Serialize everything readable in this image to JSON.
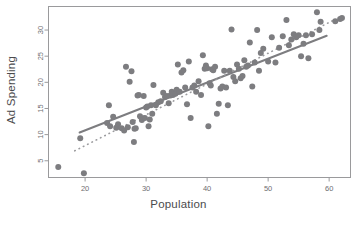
{
  "chart_data": {
    "type": "scatter",
    "title": "",
    "xlabel": "Population",
    "ylabel": "Ad Spending",
    "xlim": [
      14.0,
      63.5
    ],
    "ylim": [
      1.8,
      34.5
    ],
    "xticks": [
      20,
      30,
      40,
      50,
      60
    ],
    "yticks": [
      5,
      10,
      15,
      20,
      25,
      30
    ],
    "grid": false,
    "legend": "none",
    "point_color": "#7d7d80",
    "line_color": "#7d7d80",
    "frame_color": "#9a9a9c",
    "marker": "circle",
    "marker_size": 3.0,
    "series": [
      {
        "name": "Observations",
        "type": "scatter",
        "x": [
          15.6,
          19.2,
          19.8,
          23.6,
          23.9,
          24.1,
          24.6,
          25.1,
          25.4,
          26.0,
          26.4,
          26.7,
          27.0,
          27.3,
          27.6,
          27.8,
          28.0,
          28.1,
          28.3,
          28.6,
          28.8,
          29.0,
          29.3,
          29.6,
          29.8,
          30.0,
          30.2,
          30.4,
          30.6,
          30.8,
          31.0,
          31.2,
          31.6,
          32.0,
          32.4,
          32.8,
          33.1,
          33.4,
          33.7,
          34.0,
          34.2,
          34.4,
          34.6,
          34.8,
          35.0,
          35.2,
          35.5,
          35.8,
          36.1,
          36.4,
          36.7,
          37.0,
          37.3,
          37.6,
          37.9,
          38.2,
          38.6,
          39.0,
          39.3,
          39.6,
          39.8,
          40.0,
          40.2,
          40.4,
          40.6,
          40.8,
          41.0,
          41.3,
          41.6,
          41.9,
          42.2,
          42.5,
          42.8,
          43.1,
          43.4,
          43.7,
          44.0,
          44.3,
          44.6,
          44.9,
          45.2,
          45.5,
          45.8,
          46.1,
          46.4,
          46.7,
          47.0,
          47.4,
          47.8,
          48.2,
          48.5,
          48.8,
          49.2,
          50.0,
          50.6,
          51.2,
          51.8,
          52.4,
          53.0,
          53.4,
          53.8,
          54.2,
          54.6,
          55.0,
          55.4,
          55.8,
          56.2,
          56.6,
          57.2,
          58.0,
          58.4,
          58.6,
          61.0,
          61.8,
          62.1
        ],
        "y": [
          3.8,
          9.3,
          2.6,
          12.2,
          15.6,
          11.6,
          13.4,
          11.3,
          12.0,
          11.2,
          10.8,
          23.0,
          11.4,
          20.1,
          22.1,
          12.4,
          8.6,
          11.1,
          11.2,
          17.5,
          17.6,
          13.5,
          12.8,
          17.4,
          13.2,
          15.2,
          15.4,
          11.6,
          12.9,
          15.6,
          14.0,
          19.5,
          15.6,
          16.2,
          16.4,
          18.0,
          17.2,
          17.4,
          16.0,
          17.5,
          18.2,
          17.6,
          18.0,
          17.8,
          18.6,
          23.4,
          18.2,
          21.9,
          22.3,
          19.0,
          15.8,
          24.0,
          13.2,
          19.0,
          19.4,
          18.2,
          20.2,
          17.6,
          25.2,
          22.6,
          23.2,
          22.7,
          11.6,
          19.8,
          19.4,
          22.5,
          22.3,
          23.0,
          14.0,
          15.9,
          18.8,
          19.2,
          22.2,
          19.0,
          15.6,
          22.2,
          30.1,
          21.0,
          20.2,
          23.4,
          22.6,
          20.8,
          21.2,
          24.2,
          23.0,
          23.2,
          27.6,
          19.2,
          23.8,
          30.0,
          22.2,
          25.6,
          26.4,
          24.0,
          28.6,
          23.8,
          26.6,
          28.8,
          31.9,
          27.1,
          28.2,
          29.2,
          28.6,
          29.0,
          25.0,
          27.4,
          29.0,
          24.6,
          29.2,
          33.4,
          30.0,
          31.6,
          31.7,
          32.1,
          32.3
        ]
      },
      {
        "name": "Regression line",
        "type": "line",
        "style": "solid",
        "x": [
          19.1,
          59.6
        ],
        "y": [
          10.4,
          28.9
        ]
      },
      {
        "name": "Reference line",
        "type": "line",
        "style": "dotted",
        "x": [
          18.3,
          61.1
        ],
        "y": [
          6.9,
          32.1
        ]
      }
    ]
  },
  "axes": {
    "xlabel": "Population",
    "ylabel": "Ad Spending",
    "xticks": [
      "20",
      "30",
      "40",
      "50",
      "60"
    ],
    "yticks": [
      "5",
      "10",
      "15",
      "20",
      "25",
      "30"
    ]
  }
}
